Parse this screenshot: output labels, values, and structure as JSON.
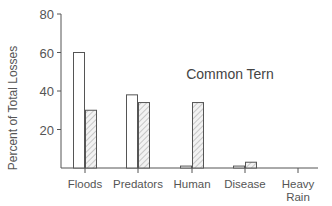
{
  "chart_data": {
    "type": "bar",
    "title": "Common Tern",
    "xlabel": "",
    "ylabel": "Percent of Total Losses",
    "ylim": [
      0,
      80
    ],
    "yticks": [
      20,
      40,
      60,
      80
    ],
    "grid": false,
    "legend": null,
    "categories": [
      "Floods",
      "Predators",
      "Human",
      "Disease",
      "Heavy Rain"
    ],
    "category_label_lines": [
      [
        "Floods"
      ],
      [
        "Predators"
      ],
      [
        "Human"
      ],
      [
        "Disease"
      ],
      [
        "Heavy",
        "Rain"
      ]
    ],
    "series": [
      {
        "name": "Series 1 (open bars)",
        "fill": "open",
        "values": [
          60,
          38,
          1,
          1,
          0
        ]
      },
      {
        "name": "Series 2 (hatched bars)",
        "fill": "hatched",
        "values": [
          30,
          34,
          34,
          3,
          0
        ]
      }
    ]
  },
  "colors": {
    "axis": "#555555",
    "bar_outline": "#555555",
    "open_fill": "#ffffff",
    "hatch": "#9a9a9a",
    "hatch_bg": "#f2f2f2"
  }
}
